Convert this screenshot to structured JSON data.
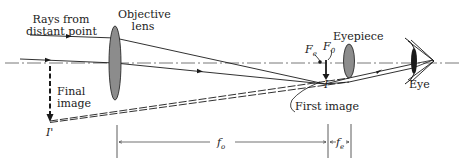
{
  "diagram": {
    "labels": {
      "rays_line1": "Rays from",
      "rays_line2": "distant point",
      "objective_line1": "Objective",
      "objective_line2": "lens",
      "eyepiece": "Eyepiece",
      "eye": "Eye",
      "fe_focal": "F",
      "fe_focal_sub": "e",
      "fo_focal": "F",
      "fo_focal_sub": "0",
      "first_image_symbol": "I",
      "first_image": "First image",
      "final_line1": "Final",
      "final_line2": "image",
      "final_image_symbol": "I'",
      "fo_dim": "f",
      "fo_dim_sub": "o",
      "fe_dim": "f",
      "fe_dim_sub": "e"
    },
    "colors": {
      "line": "#1a1a1a",
      "lens_fill": "#8c8c8c",
      "lens_stroke": "#2a2a2a",
      "axis": "#444444",
      "background": "#ffffff"
    }
  }
}
